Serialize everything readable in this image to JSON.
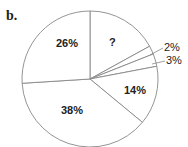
{
  "panel_label": "b.",
  "chart_data": {
    "type": "pie",
    "title": "",
    "start_angle": "12 o'clock",
    "direction": "clockwise",
    "slices": [
      {
        "label": "?",
        "value": 17,
        "display": "?"
      },
      {
        "label": "2%",
        "value": 2,
        "display": "2%"
      },
      {
        "label": "3%",
        "value": 3,
        "display": "3%"
      },
      {
        "label": "14%",
        "value": 14,
        "display": "14%"
      },
      {
        "label": "38%",
        "value": 38,
        "display": "38%"
      },
      {
        "label": "26%",
        "value": 26,
        "display": "26%"
      }
    ],
    "unknown_slice_inferred_value": 17,
    "fill": "#ffffff",
    "stroke": "#888888"
  }
}
